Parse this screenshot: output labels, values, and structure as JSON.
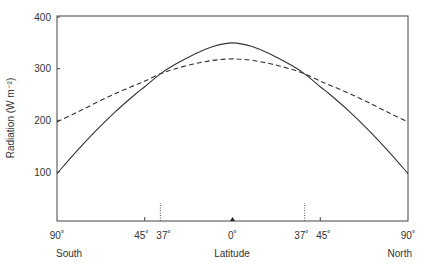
{
  "chart_data": {
    "type": "line",
    "title": "",
    "xlabel": "Latitude",
    "ylabel": "Radiation (W m⁻²)",
    "ylim": [
      0,
      400
    ],
    "xlim": [
      -90,
      90
    ],
    "grid": false,
    "legend": null,
    "y_ticks": [
      100,
      200,
      300,
      400
    ],
    "x_ticks": [
      {
        "value": -90,
        "label": "90˚"
      },
      {
        "value": -45,
        "label": "45˚"
      },
      {
        "value": -37,
        "label": "37˚"
      },
      {
        "value": 0,
        "label": "0˚"
      },
      {
        "value": 37,
        "label": "37˚"
      },
      {
        "value": 45,
        "label": "45˚"
      },
      {
        "value": 90,
        "label": "90˚"
      }
    ],
    "hemisphere_labels": {
      "left": "South",
      "right": "North"
    },
    "annotations": [
      {
        "type": "vertical-dotted",
        "x": -37
      },
      {
        "type": "vertical-dotted",
        "x": 37
      },
      {
        "type": "marker-triangle",
        "x": 0
      }
    ],
    "x": [
      -90,
      -80,
      -70,
      -60,
      -50,
      -45,
      -37,
      -30,
      -20,
      -10,
      0,
      10,
      20,
      30,
      37,
      45,
      50,
      60,
      70,
      80,
      90
    ],
    "series": [
      {
        "name": "Absorbed solar radiation",
        "style": "solid",
        "values": [
          97,
          140,
          180,
          217,
          250,
          265,
          290,
          307,
          327,
          343,
          350,
          343,
          327,
          307,
          290,
          265,
          250,
          217,
          180,
          140,
          97
        ]
      },
      {
        "name": "Outgoing longwave radiation",
        "style": "dashed",
        "values": [
          197,
          215,
          234,
          252,
          268,
          276,
          290,
          299,
          309,
          316,
          319,
          316,
          309,
          299,
          290,
          276,
          268,
          252,
          234,
          215,
          197
        ]
      }
    ]
  }
}
